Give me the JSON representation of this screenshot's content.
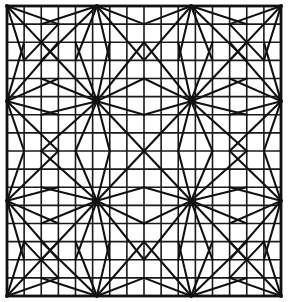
{
  "figure": {
    "kind": "geometric-mesh-diagram",
    "background_color": "#ffffff",
    "line_color": "#111111",
    "grid_line_color": "#1a1a1a",
    "frame": {
      "x": 7,
      "y": 6,
      "width": 274,
      "height": 290,
      "stroke_width": 2.8
    },
    "grid": {
      "columns": 16,
      "rows": 16,
      "cell_width": 17.125,
      "cell_height": 18.125,
      "stroke_width": 1.6
    },
    "hubs": {
      "description": "Singular vertices where many triangle fans meet",
      "spokes_per_hub": 12,
      "columns_x": [
        7,
        97,
        192,
        281
      ],
      "rows_y": [
        6,
        105,
        200,
        296
      ],
      "full_interior_hubs": [
        {
          "x": 97,
          "y": 105
        },
        {
          "x": 192,
          "y": 105
        },
        {
          "x": 97,
          "y": 200
        },
        {
          "x": 192,
          "y": 200
        }
      ],
      "edge_hubs": [
        {
          "x": 97,
          "y": 6
        },
        {
          "x": 192,
          "y": 6
        },
        {
          "x": 97,
          "y": 296
        },
        {
          "x": 192,
          "y": 296
        },
        {
          "x": 7,
          "y": 105
        },
        {
          "x": 7,
          "y": 200
        },
        {
          "x": 281,
          "y": 105
        },
        {
          "x": 281,
          "y": 200
        }
      ],
      "corner_hubs": [
        {
          "x": 7,
          "y": 6
        },
        {
          "x": 281,
          "y": 6
        },
        {
          "x": 7,
          "y": 296
        },
        {
          "x": 281,
          "y": 296
        }
      ]
    },
    "motif": {
      "name": "pinwheel-fan",
      "repeat_x": 95,
      "repeat_y": 95,
      "ring_radius_cells": 3
    }
  },
  "chart_data": {
    "type": "scatter",
    "xlabel": "",
    "ylabel": "",
    "grid": true,
    "legend": "none",
    "xlim": [
      0,
      16
    ],
    "ylim": [
      0,
      16
    ],
    "categories": [
      "hub",
      "grid-node"
    ],
    "series": [
      {
        "name": "hub",
        "x": [
          0,
          5.25,
          10.8,
          16,
          0,
          5.25,
          10.8,
          16,
          0,
          5.25,
          10.8,
          16,
          0,
          5.25,
          10.8,
          16
        ],
        "y": [
          16,
          16,
          16,
          16,
          10.55,
          10.55,
          10.55,
          10.55,
          5.3,
          5.3,
          5.3,
          5.3,
          0,
          0,
          0,
          0
        ],
        "values": [
          12,
          12,
          12,
          12,
          12,
          12,
          12,
          12,
          12,
          12,
          12,
          12,
          12,
          12,
          12,
          12
        ]
      }
    ]
  }
}
